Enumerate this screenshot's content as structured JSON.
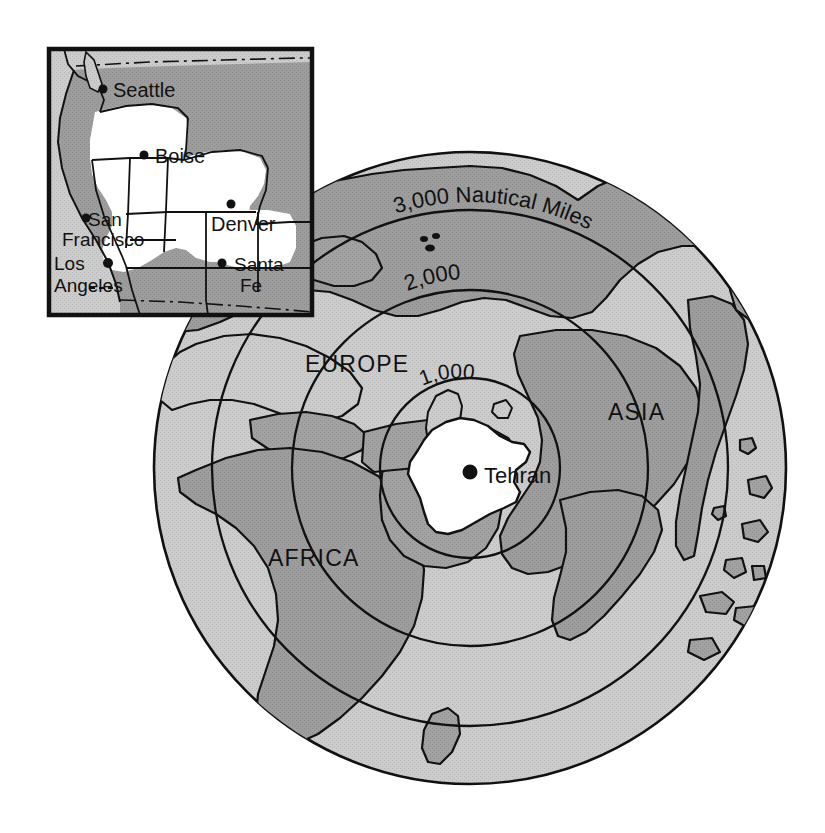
{
  "figure": {
    "kind": "azimuthal-range-ring-map",
    "center_city": "Tehran",
    "distance_unit": "Nautical Miles"
  },
  "main_map": {
    "center_label": "Tehran",
    "center_dot": "city-dot",
    "continents": [
      {
        "name": "EUROPE"
      },
      {
        "name": "ASIA"
      },
      {
        "name": "AFRICA"
      }
    ],
    "range_rings": [
      {
        "value": "1,000",
        "label": "1,000"
      },
      {
        "value": "2,000",
        "label": "2,000"
      },
      {
        "value": "3,000",
        "label": "3,000"
      }
    ],
    "ring_unit_label": "Nautical Miles",
    "outer_ring_full_label": "3,000 Nautical Miles"
  },
  "inset_map": {
    "region": "Western United States",
    "cities": [
      {
        "name": "Seattle"
      },
      {
        "name": "Boise"
      },
      {
        "name": "Denver"
      },
      {
        "name": "San\nFrancisco",
        "line1": "San",
        "line2": "Francisco"
      },
      {
        "name": "Los\nAngeles",
        "line1": "Los",
        "line2": "Angeles"
      },
      {
        "name": "Santa\nFe",
        "line1": "Santa",
        "line2": "Fe"
      }
    ]
  },
  "colors": {
    "ocean": "#c9c9c9",
    "land": "#9a9a9a",
    "highlight": "#ffffff",
    "outline": "#111111",
    "text": "#111111",
    "background": "#ffffff"
  }
}
